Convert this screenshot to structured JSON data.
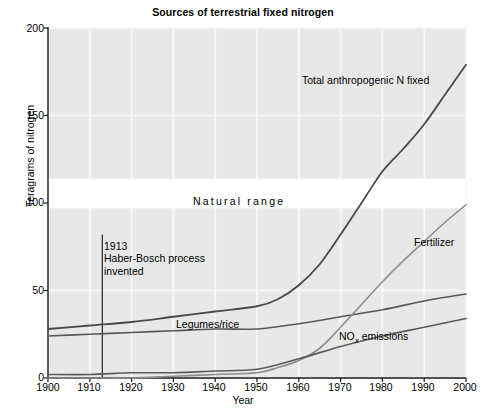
{
  "chart_data": {
    "type": "line",
    "title": "Sources of terrestrial fixed nitrogen",
    "xlabel": "Year",
    "ylabel": "Teragrams of nitrogen",
    "xlim": [
      1900,
      2000
    ],
    "ylim": [
      0,
      200
    ],
    "xticks": [
      1900,
      1910,
      1920,
      1930,
      1940,
      1950,
      1960,
      1970,
      1980,
      1990,
      2000
    ],
    "yticks": [
      0,
      50,
      100,
      150,
      200
    ],
    "grid": true,
    "legend_position": "inline-labels",
    "bands": [
      {
        "name": "Natural range",
        "label": "Natural range",
        "y_from": 97,
        "y_to": 114,
        "color": "#ffffff"
      }
    ],
    "annotations": [
      {
        "name": "haber-bosch",
        "year": 1913,
        "lines": [
          "1913",
          "Haber-Bosch process",
          "invented"
        ],
        "line_y_from": 0,
        "line_y_to": 82
      }
    ],
    "series": [
      {
        "name": "Total anthropogenic N fixed",
        "label": "Total anthropogenic N fixed",
        "color": "#4a4a4a",
        "width": 1.8,
        "x": [
          1900,
          1910,
          1920,
          1930,
          1940,
          1950,
          1955,
          1960,
          1965,
          1970,
          1975,
          1980,
          1985,
          1990,
          1995,
          2000
        ],
        "values": [
          28,
          30,
          32,
          35,
          38,
          41,
          45,
          53,
          65,
          82,
          100,
          118,
          131,
          145,
          162,
          179
        ]
      },
      {
        "name": "Legumes/rice",
        "label": "Legumes/rice",
        "color": "#585858",
        "width": 1.6,
        "x": [
          1900,
          1910,
          1920,
          1930,
          1940,
          1950,
          1960,
          1970,
          1980,
          1990,
          2000
        ],
        "values": [
          24,
          25,
          26,
          27,
          28,
          28,
          31,
          35,
          39,
          44,
          48
        ]
      },
      {
        "name": "Fertilizer",
        "label": "Fertilizer",
        "color": "#8c8c8c",
        "width": 1.6,
        "x": [
          1900,
          1910,
          1920,
          1930,
          1940,
          1950,
          1955,
          1960,
          1965,
          1970,
          1975,
          1980,
          1985,
          1990,
          1995,
          2000
        ],
        "values": [
          0,
          0,
          0,
          1,
          2,
          3,
          6,
          10,
          17,
          29,
          42,
          55,
          67,
          78,
          89,
          99
        ]
      },
      {
        "name": "NOx emissions",
        "label": "NO<sub>x</sub> emissions",
        "label_plain": "NOx emissions",
        "color": "#5a5a5a",
        "width": 1.6,
        "x": [
          1900,
          1910,
          1920,
          1930,
          1940,
          1950,
          1960,
          1970,
          1980,
          1990,
          2000
        ],
        "values": [
          2,
          2,
          3,
          3,
          4,
          5,
          11,
          18,
          24,
          29,
          34
        ]
      }
    ],
    "inline_labels": {
      "total": "Total anthropogenic N fixed",
      "fertilizer": "Fertilizer",
      "legumes": "Legumes/rice",
      "nox_prefix": "NO",
      "nox_sub": "x",
      "nox_suffix": " emissions",
      "natural_range": "Natural range"
    },
    "colors": {
      "plot_background": "#e8e8e8",
      "grid": "#f6f6f6",
      "band": "#ffffff",
      "axis": "#1a1a1a",
      "total": "#4a4a4a",
      "legumes": "#585858",
      "fertilizer": "#8c8c8c",
      "nox": "#5a5a5a"
    }
  },
  "ytick_labels": [
    "200",
    "150",
    "100",
    "50",
    "0"
  ],
  "xtick_labels": [
    "1900",
    "1910",
    "1920",
    "1930",
    "1940",
    "1950",
    "1960",
    "1970",
    "1980",
    "1990",
    "2000"
  ],
  "annotation_lines": {
    "l1": "1913",
    "l2": "Haber-Bosch process",
    "l3": "invented"
  }
}
